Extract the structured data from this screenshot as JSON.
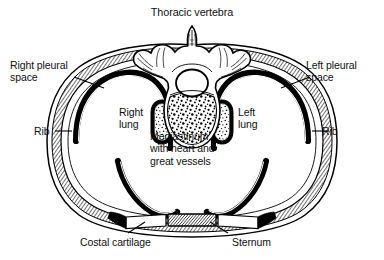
{
  "figure": {
    "kind": "anatomical-line-drawing",
    "view": "transverse section through the thorax",
    "style": "black and white engraved line art",
    "background_color": "#ffffff",
    "ink_color": "#000000"
  },
  "labels": {
    "title": "Thoracic vertebra",
    "right_pleural_space": "Right pleural\nspace",
    "left_pleural_space": "Left pleural\nspace",
    "rib_left": "Rib",
    "rib_right": "Rib",
    "right_lung": "Right\nlung",
    "left_lung": "Left\nlung",
    "mediastinum": "Mediastinum\nwith heart and\ngreat vessels",
    "costal_cartilage": "Costal cartilage",
    "sternum": "Sternum"
  },
  "structures": [
    {
      "name": "thoracic-vertebra",
      "parts": [
        "spinous process",
        "transverse processes",
        "vertebral foramen",
        "vertebral body with trabecular stipple"
      ]
    },
    {
      "name": "thoracic-wall",
      "layers": [
        "outer skin line",
        "rib layer with hatching",
        "pleural space",
        "thick parietal pleura line"
      ]
    },
    {
      "name": "right-lung-cavity"
    },
    {
      "name": "left-lung-cavity"
    },
    {
      "name": "mediastinum"
    },
    {
      "name": "diaphragm-costal-recess"
    },
    {
      "name": "sternum"
    },
    {
      "name": "costal-cartilage"
    }
  ]
}
